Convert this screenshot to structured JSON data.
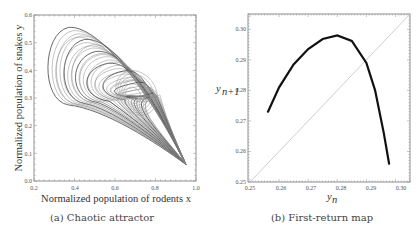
{
  "chart_data": [
    {
      "type": "line",
      "panel": "a",
      "caption": "(a) Chaotic attractor",
      "title": "",
      "xlabel": "Normalized population of rodents x",
      "ylabel": "Normalized population of snakes y",
      "xlim": [
        0.2,
        1.0
      ],
      "ylim": [
        0.0,
        0.6
      ],
      "xticks": [
        "0.2",
        "0.4",
        "0.6",
        "0.8",
        "1.0"
      ],
      "yticks": [
        "0.0",
        "0.1",
        "0.2",
        "0.3",
        "0.4",
        "0.5",
        "0.6"
      ],
      "grid": false,
      "legend": null,
      "description": "Phase-space trajectory (many grey loops) forming a chaotic attractor; loops span x≈0.25–0.95, y≈0.06–0.55, converging to a tip near (0.95, 0.06) with an inner spiral near (0.7, 0.3).",
      "series": [
        {
          "name": "trajectory",
          "x": [
            0.95,
            0.8,
            0.62,
            0.48,
            0.38,
            0.29,
            0.25,
            0.27,
            0.33,
            0.42,
            0.52,
            0.62,
            0.72,
            0.82,
            0.9,
            0.95
          ],
          "y": [
            0.06,
            0.15,
            0.25,
            0.27,
            0.28,
            0.33,
            0.42,
            0.5,
            0.54,
            0.55,
            0.52,
            0.43,
            0.32,
            0.2,
            0.11,
            0.06
          ]
        }
      ]
    },
    {
      "type": "line",
      "panel": "b",
      "caption": "(b) First-return map",
      "title": "",
      "xlabel": "y_n",
      "ylabel": "y_n+1",
      "xlim": [
        0.25,
        0.305
      ],
      "ylim": [
        0.25,
        0.305
      ],
      "xticks": [
        "0.25",
        "0.26",
        "0.27",
        "0.28",
        "0.29",
        "0.30"
      ],
      "yticks": [
        "0.25",
        "0.26",
        "0.27",
        "0.28",
        "0.29",
        "0.30"
      ],
      "grid": false,
      "legend": null,
      "series": [
        {
          "name": "first-return map",
          "x": [
            0.2562,
            0.26,
            0.265,
            0.27,
            0.275,
            0.28,
            0.285,
            0.29,
            0.293,
            0.296,
            0.2978
          ],
          "y": [
            0.273,
            0.281,
            0.2885,
            0.2935,
            0.2968,
            0.298,
            0.2962,
            0.289,
            0.28,
            0.266,
            0.256
          ]
        },
        {
          "name": "identity line y_n+1 = y_n",
          "x": [
            0.25,
            0.305
          ],
          "y": [
            0.25,
            0.305
          ]
        }
      ]
    }
  ],
  "panels": {
    "a": {
      "caption": "(a) Chaotic attractor",
      "xlabel": "Normalized population of rodents x",
      "ylabel": "Normalized population of snakes y",
      "xticks": [
        "0.2",
        "0.4",
        "0.6",
        "0.8",
        "1.0"
      ],
      "yticks": [
        "0.0",
        "0.1",
        "0.2",
        "0.3",
        "0.4",
        "0.5",
        "0.6"
      ]
    },
    "b": {
      "caption": "(b) First-return map",
      "xlabel_base": "y",
      "xlabel_sub": "n",
      "ylabel_base": "y",
      "ylabel_sub": "n+1",
      "xticks": [
        "0.25",
        "0.26",
        "0.27",
        "0.28",
        "0.29",
        "0.30"
      ],
      "yticks": [
        "0.25",
        "0.26",
        "0.27",
        "0.28",
        "0.29",
        "0.30"
      ]
    }
  }
}
